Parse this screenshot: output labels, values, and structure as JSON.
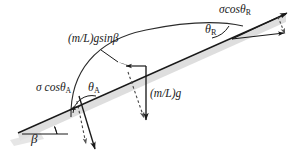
{
  "figure": {
    "background_color": "#ffffff",
    "line_color": "#1a1a1a",
    "shadow_color": "#d8d8d8",
    "width": 293,
    "height": 156
  },
  "labels": {
    "sigma_cos_theta_a": {
      "text": "σ cosθ",
      "sub": "A",
      "name": "sigma-cos-theta-a"
    },
    "sigma_cos_theta_r": {
      "text": "σcosθ",
      "sub": "R",
      "name": "sigma-cos-theta-r"
    },
    "theta_a": {
      "text": "θ",
      "sub": "A",
      "name": "theta-a"
    },
    "theta_r": {
      "text": "θ",
      "sub": "R",
      "name": "theta-r"
    },
    "mlg_sin_beta": {
      "text": "(m/L)gsinβ",
      "name": "mlg-sin-beta"
    },
    "mlg": {
      "text": "(m/L)g",
      "name": "mlg"
    },
    "beta": {
      "text": "β",
      "name": "beta"
    }
  },
  "geometry": {
    "incline_start": [
      18,
      133
    ],
    "incline_end": [
      286,
      14
    ],
    "incline_angle_deg": 24,
    "contact_point_a": [
      82,
      105
    ],
    "contact_point_r": [
      233,
      38
    ],
    "horizontal_ref_start": [
      22,
      134
    ],
    "horizontal_ref_end": [
      68,
      134
    ]
  },
  "arrows": [
    {
      "name": "sigma-cos-theta-a-vector",
      "style": "solid",
      "from": [
        78,
        97
      ],
      "to": [
        95,
        152
      ]
    },
    {
      "name": "gravity-component-a-dashed",
      "style": "dashed",
      "from": [
        76,
        102
      ],
      "to": [
        87,
        148
      ]
    },
    {
      "name": "weight-vector-mlg",
      "style": "solid",
      "from": [
        146,
        66
      ],
      "to": [
        146,
        124
      ]
    },
    {
      "name": "weight-component-dashed",
      "style": "dashed",
      "from": [
        128,
        72
      ],
      "to": [
        145,
        122
      ]
    },
    {
      "name": "mlg-sin-beta-vector",
      "style": "solid",
      "from": [
        146,
        66
      ],
      "to": [
        122,
        66
      ]
    },
    {
      "name": "sigma-cos-theta-r-vector",
      "style": "solid",
      "from": [
        232,
        39
      ],
      "to": [
        287,
        13
      ]
    },
    {
      "name": "horizontal-reaction-r",
      "style": "solid",
      "from": [
        232,
        39
      ],
      "to": [
        285,
        33
      ]
    },
    {
      "name": "dashed-component-r",
      "style": "dashed",
      "from": [
        277,
        16
      ],
      "to": [
        285,
        35
      ]
    }
  ]
}
